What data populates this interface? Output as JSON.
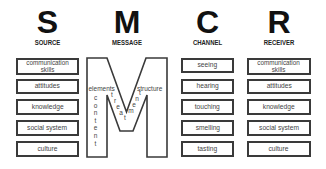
{
  "columns": [
    {
      "letter": "S",
      "label": "SOURCE",
      "items": [
        "communication skills",
        "attitudes",
        "knowledge",
        "social system",
        "culture"
      ]
    },
    {
      "letter": "M",
      "label": "MESSAGE",
      "m_labels": {
        "left": "elements",
        "right": "structure",
        "vertical": "content",
        "diagonal": "treatment"
      }
    },
    {
      "letter": "C",
      "label": "CHANNEL",
      "items": [
        "seeing",
        "hearing",
        "touching",
        "smelling",
        "tasting"
      ]
    },
    {
      "letter": "R",
      "label": "RECEIVER",
      "items": [
        "communication skills",
        "attitudes",
        "knowledge",
        "social system",
        "culture"
      ]
    }
  ],
  "source_item0_line1": "communication",
  "source_item0_line2": "skills",
  "receiver_item0_line1": "communication",
  "receiver_item0_line2": "skills",
  "colors": {
    "outline": "#3a3a3a",
    "text": "#444444",
    "heading": "#111111",
    "background": "#ffffff"
  }
}
